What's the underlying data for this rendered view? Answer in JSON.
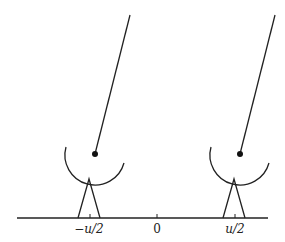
{
  "diagram": {
    "axis": {
      "labels": {
        "left": "−u/2",
        "center": "0",
        "right": "u/2"
      }
    },
    "objects": [
      {
        "name": "left-pendulum",
        "position_label": "−u/2"
      },
      {
        "name": "right-pendulum",
        "position_label": "u/2"
      }
    ],
    "colors": {
      "stroke": "#222222",
      "background": "#ffffff"
    }
  }
}
